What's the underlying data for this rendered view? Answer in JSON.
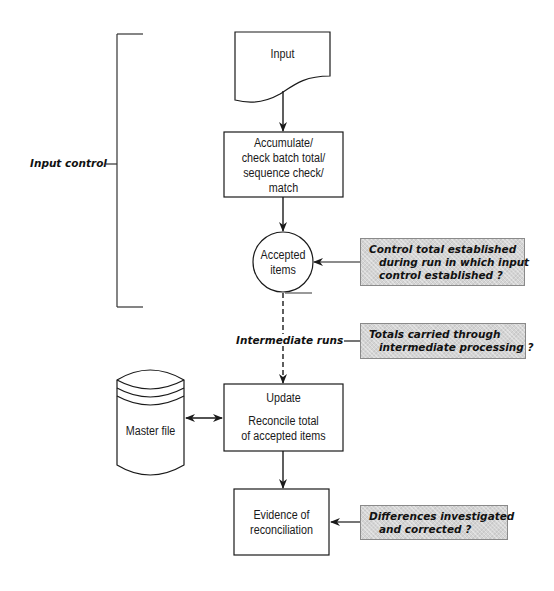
{
  "diagram": {
    "bracket": {
      "label": "Input control"
    },
    "nodes": {
      "input": {
        "label": "Input",
        "shape": "document"
      },
      "accumulate": {
        "shape": "process",
        "lines": [
          "Accumulate/",
          "check batch total/",
          "sequence check/",
          "match"
        ]
      },
      "accepted": {
        "shape": "connector-circle",
        "lines": [
          "Accepted",
          "items"
        ]
      },
      "intermediate": {
        "label": "Intermediate runs"
      },
      "master_file": {
        "label": "Master file",
        "shape": "disk-storage"
      },
      "update": {
        "shape": "process",
        "title": "Update",
        "lines": [
          "Reconcile total",
          "of accepted items"
        ]
      },
      "evidence": {
        "shape": "process",
        "lines": [
          "Evidence of",
          "reconciliation"
        ]
      }
    },
    "notes": [
      {
        "id": "note-control-total",
        "lines": [
          "Control total established",
          "during run in which input",
          "control established ?"
        ]
      },
      {
        "id": "note-totals-carried",
        "lines": [
          "Totals carried through",
          "intermediate processing ?"
        ]
      },
      {
        "id": "note-differences",
        "lines": [
          "Differences investigated",
          "and corrected ?"
        ]
      }
    ],
    "colors": {
      "line": "#1a1a1a",
      "note_fill": "#d4d4d4",
      "note_border": "#8a8a8a"
    }
  }
}
